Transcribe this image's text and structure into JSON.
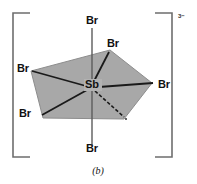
{
  "figure": {
    "caption": "(b)",
    "charge": "3−",
    "center_atom": "Sb",
    "geometry_name": "pentagonal-bipyramidal",
    "colors": {
      "polygon_fill": "#a8a8a8",
      "polygon_stroke": "#8d8d8d",
      "bond": "#1a1a1a",
      "bracket": "#6e6e6e",
      "background": "#ffffff",
      "text": "#111111"
    },
    "brackets": {
      "left_symbol": "[",
      "right_symbol": "]"
    },
    "ligands": [
      {
        "label": "Br",
        "position": "axial-top",
        "x": 92,
        "y": 23
      },
      {
        "label": "Br",
        "position": "equatorial-upper-right",
        "x": 112,
        "y": 46
      },
      {
        "label": "Br",
        "position": "equatorial-left",
        "x": 22,
        "y": 71
      },
      {
        "label": "Br",
        "position": "equatorial-right",
        "x": 160,
        "y": 87
      },
      {
        "label": "Br",
        "position": "equatorial-lower-left",
        "x": 24,
        "y": 116
      },
      {
        "label": "Br",
        "position": "axial-bottom",
        "x": 92,
        "y": 151
      }
    ],
    "center": {
      "label": "Sb",
      "x": 92,
      "y": 87
    },
    "ligand_count_visible": 6,
    "hidden_ligand_note": "dashed bond lower-right"
  }
}
